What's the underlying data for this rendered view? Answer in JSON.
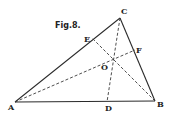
{
  "figure": {
    "title": "Fig.8.",
    "points": {
      "A": {
        "label": "A",
        "x": 15,
        "y": 102
      },
      "B": {
        "label": "B",
        "x": 155,
        "y": 101
      },
      "C": {
        "label": "C",
        "x": 120,
        "y": 18
      },
      "D": {
        "label": "D",
        "x": 107,
        "y": 102
      },
      "E": {
        "label": "E",
        "x": 92,
        "y": 38
      },
      "F": {
        "label": "F",
        "x": 135,
        "y": 50
      },
      "O": {
        "label": "O",
        "x": 113,
        "y": 59
      }
    },
    "solid_segments": [
      [
        "A",
        "B"
      ],
      [
        "B",
        "C"
      ],
      [
        "C",
        "A"
      ]
    ],
    "dashed_segments": [
      [
        "A",
        "F"
      ],
      [
        "B",
        "E"
      ],
      [
        "C",
        "D"
      ]
    ]
  }
}
